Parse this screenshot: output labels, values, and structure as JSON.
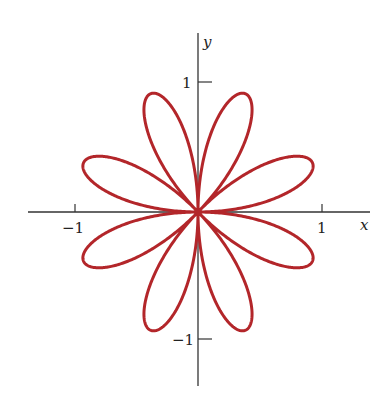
{
  "chart_data": {
    "type": "line",
    "title": "",
    "equation": "r = sin(4θ)",
    "xlabel": "x",
    "ylabel": "y",
    "xlim": [
      -1.3,
      1.4
    ],
    "ylim": [
      -1.4,
      1.4
    ],
    "x_ticks": [
      {
        "value": -1,
        "label": "−1"
      },
      {
        "value": 1,
        "label": "1"
      }
    ],
    "y_ticks": [
      {
        "value": 1,
        "label": "1"
      },
      {
        "value": -1,
        "label": "−1"
      }
    ],
    "series": [
      {
        "name": "rose",
        "petals": 8,
        "k": 4,
        "amplitude": 1,
        "color": "#b3262a"
      }
    ],
    "grid": false,
    "legend": null
  },
  "axes": {
    "x_label": "x",
    "y_label": "y",
    "tick_x_neg": "−1",
    "tick_x_pos": "1",
    "tick_y_pos": "1",
    "tick_y_neg": "−1"
  },
  "colors": {
    "curve": "#b3262a",
    "axis": "#333333"
  }
}
